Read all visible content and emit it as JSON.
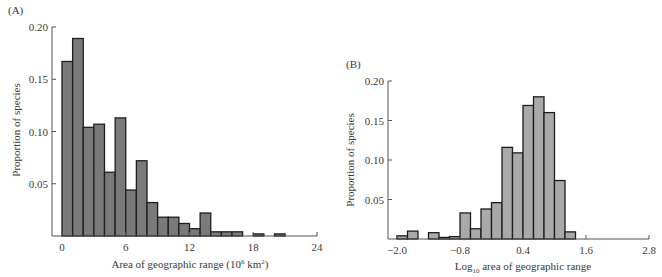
{
  "chart_data": [
    {
      "type": "bar",
      "panel_label": "(A)",
      "title": "",
      "xlabel": "Area of geographic range (10",
      "xlabel_sup": "6",
      "xlabel_mid": " km",
      "xlabel_sup2": "2",
      "xlabel_end": ")",
      "ylabel": "Proportion of species",
      "xlim": [
        0,
        24
      ],
      "ylim": [
        0,
        0.2
      ],
      "xticks": [
        "0",
        "6",
        "12",
        "18",
        "24"
      ],
      "xtick_values": [
        0,
        6,
        12,
        18,
        24
      ],
      "yticks": [
        "0.05",
        "0.10",
        "0.15",
        "0.20"
      ],
      "ytick_values": [
        0.05,
        0.1,
        0.15,
        0.2
      ],
      "bin_width": 1,
      "bin_starts": [
        0,
        1,
        2,
        3,
        4,
        5,
        6,
        7,
        8,
        9,
        10,
        11,
        12,
        13,
        14,
        15,
        16,
        17,
        18,
        19,
        20,
        21,
        22,
        23
      ],
      "values": [
        0.167,
        0.189,
        0.104,
        0.107,
        0.061,
        0.113,
        0.044,
        0.072,
        0.032,
        0.018,
        0.018,
        0.012,
        0.007,
        0.022,
        0.004,
        0.004,
        0.004,
        0,
        0.002,
        0,
        0.002,
        0,
        0,
        0
      ],
      "bar_color": "#7a7a7a",
      "grid": false,
      "legend": null
    },
    {
      "type": "bar",
      "panel_label": "(B)",
      "title": "",
      "xlabel_prefix": "Log",
      "xlabel_sub": "10",
      "xlabel": " area of geographic range",
      "ylabel": "Proportion of species",
      "xlim": [
        -2.0,
        2.8
      ],
      "ylim": [
        0,
        0.2
      ],
      "xticks": [
        "-2.0",
        "-0.8",
        "0.4",
        "1.6",
        "2.8"
      ],
      "xtick_values": [
        -2.0,
        -0.8,
        0.4,
        1.6,
        2.8
      ],
      "yticks": [
        "0.05",
        "0.10",
        "0.15",
        "0.20"
      ],
      "ytick_values": [
        0.05,
        0.1,
        0.15,
        0.2
      ],
      "bin_width": 0.2,
      "bin_starts": [
        -2.0,
        -1.8,
        -1.6,
        -1.4,
        -1.2,
        -1.0,
        -0.8,
        -0.6,
        -0.4,
        -0.2,
        0.0,
        0.2,
        0.4,
        0.6,
        0.8,
        1.0,
        1.2
      ],
      "values": [
        0.004,
        0.01,
        0,
        0.008,
        0.002,
        0.003,
        0.033,
        0.013,
        0.038,
        0.046,
        0.116,
        0.109,
        0.169,
        0.18,
        0.16,
        0.074,
        0.009
      ],
      "bar_color": "#a9a9a9",
      "grid": false,
      "legend": null
    }
  ]
}
